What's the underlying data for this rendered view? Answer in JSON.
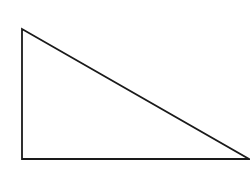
{
  "diagram": {
    "type": "right-triangle",
    "background": "#ffffff",
    "stroke_color": "#1a1a1a",
    "stroke_width": 1.8,
    "fill": "none",
    "vertices": {
      "top": [
        22,
        29
      ],
      "bottom_left": [
        22,
        159
      ],
      "bottom_right": [
        249,
        159
      ]
    },
    "points": "22,29 22,159 249,159"
  }
}
